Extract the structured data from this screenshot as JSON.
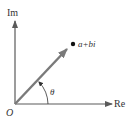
{
  "diagram": {
    "axes": {
      "vertical_label": "Im",
      "horizontal_label": "Re",
      "origin_label": "O"
    },
    "point_label": "a+bi",
    "angle_label": "θ",
    "colors": {
      "axis": "#5a5a5a",
      "vector": "#7a7a7a",
      "text": "#333333",
      "point": "#111111"
    }
  }
}
